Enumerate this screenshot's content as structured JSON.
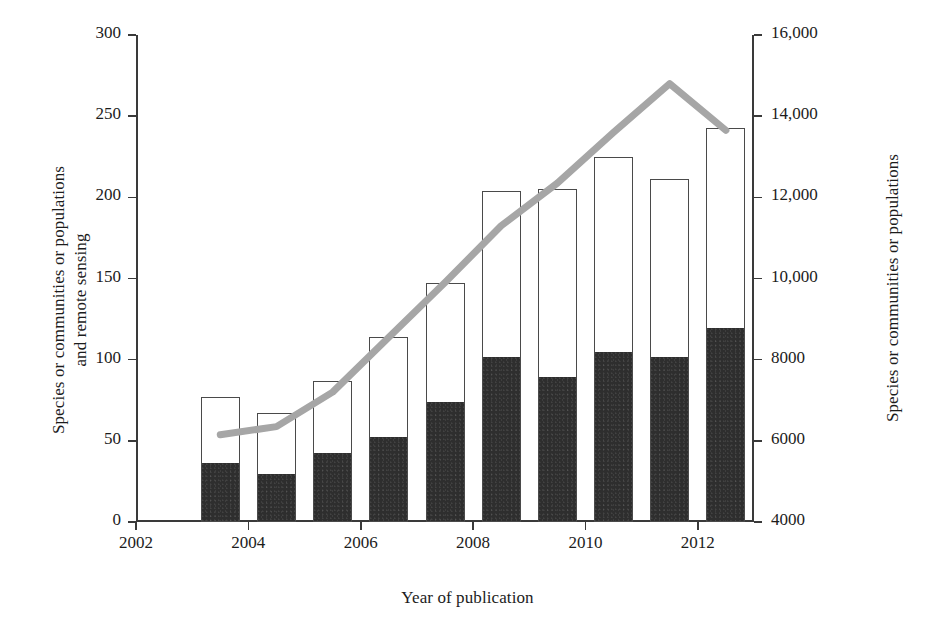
{
  "chart_data": {
    "type": "bar",
    "title": "",
    "xlabel": "Year of publication",
    "ylabel": "Species or communities or populations and remote sensing",
    "ylabel_line1": "Species or communities or populations",
    "ylabel_line2": "and remote sensing",
    "ylabel_right": "Species or communities or populations",
    "categories": [
      "2003",
      "2004",
      "2005",
      "2006",
      "2007",
      "2008",
      "2009",
      "2010",
      "2011",
      "2012"
    ],
    "x_tick_labels": [
      "2002",
      "2004",
      "2006",
      "2008",
      "2010",
      "2012"
    ],
    "x_tick_values": [
      2002,
      2004,
      2006,
      2008,
      2010,
      2012
    ],
    "xlim": [
      2002,
      2013
    ],
    "ylim": [
      0,
      300
    ],
    "y_tick_labels": [
      "0",
      "50",
      "100",
      "150",
      "200",
      "250",
      "300"
    ],
    "y_tick_values": [
      0,
      50,
      100,
      150,
      200,
      250,
      300
    ],
    "ylim_right": [
      4000,
      16000
    ],
    "y_tick_labels_right": [
      "4000",
      "6000",
      "8000",
      "10,000",
      "12,000",
      "14,000",
      "16,000"
    ],
    "y_tick_values_right": [
      4000,
      6000,
      8000,
      10000,
      12000,
      14000,
      16000
    ],
    "grid": false,
    "legend": "none",
    "series": [
      {
        "name": "Species or communities or populations (black, bar lower segment)",
        "type": "bar",
        "axis": "left",
        "color": "#2e2e2e",
        "values": [
          36,
          29,
          42,
          52,
          73,
          101,
          89,
          104,
          101,
          119
        ]
      },
      {
        "name": "Total including remote sensing (white, bar full height)",
        "type": "bar",
        "axis": "left",
        "color": "#ffffff",
        "edgecolor": "#4a4a4a",
        "values": [
          77,
          67,
          87,
          114,
          147,
          204,
          205,
          225,
          211,
          243
        ]
      },
      {
        "name": "Species or communities or populations (grey line)",
        "type": "line",
        "axis": "right",
        "color": "#a6a6a6",
        "x": [
          2003,
          2004,
          2005,
          2006,
          2007,
          2008,
          2009,
          2010,
          2011,
          2012
        ],
        "values": [
          6150,
          6350,
          7200,
          8550,
          9900,
          11300,
          12350,
          13600,
          14800,
          13650
        ]
      }
    ]
  },
  "colors": {
    "bar_fill": "#2e2e2e",
    "bar_edge": "#4a4a4a",
    "line": "#a6a6a6",
    "axis": "#3a3a3a",
    "text": "#1c1c1c",
    "background": "#ffffff"
  }
}
